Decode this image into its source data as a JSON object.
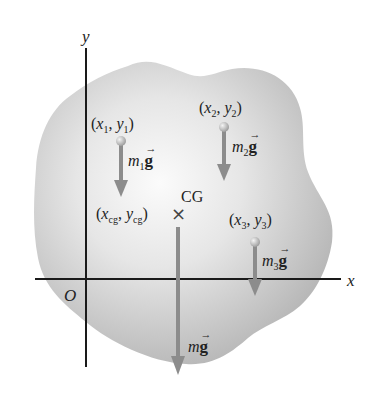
{
  "figure": {
    "type": "center-of-gravity-diagram",
    "colors": {
      "background": "#ffffff",
      "body_fill_center": "#fafafa",
      "body_fill_edge": "#b9b9b9",
      "axis": "#1a1a1a",
      "force_arrow": "#8c8c8c",
      "mass_point": "#c8c8c8",
      "text": "#222222"
    },
    "axes": {
      "x_label": "x",
      "y_label": "y",
      "origin_label": "O"
    },
    "masses": [
      {
        "coord_x": "x",
        "coord_x_sub": "1",
        "coord_y": "y",
        "coord_y_sub": "1",
        "mass": "m",
        "mass_sub": "1",
        "force_vec": "g",
        "vec_arrow": "→"
      },
      {
        "coord_x": "x",
        "coord_x_sub": "2",
        "coord_y": "y",
        "coord_y_sub": "2",
        "mass": "m",
        "mass_sub": "2",
        "force_vec": "g",
        "vec_arrow": "→"
      },
      {
        "coord_x": "x",
        "coord_x_sub": "3",
        "coord_y": "y",
        "coord_y_sub": "3",
        "mass": "m",
        "mass_sub": "3",
        "force_vec": "g",
        "vec_arrow": "→"
      }
    ],
    "center_of_gravity": {
      "label": "CG",
      "marker": "×",
      "coord_x": "x",
      "coord_x_sub": "cg",
      "coord_y": "y",
      "coord_y_sub": "cg",
      "mass": "m",
      "force_vec": "g",
      "vec_arrow": "→"
    },
    "punct": {
      "open": "(",
      "comma": ",",
      "close": ")"
    }
  }
}
